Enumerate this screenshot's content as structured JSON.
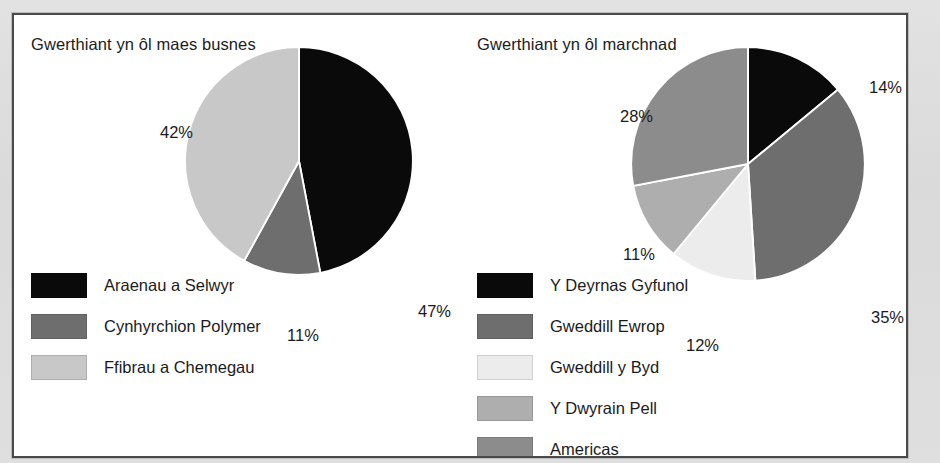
{
  "chart_data": [
    {
      "type": "pie",
      "title": "Gwerthiant yn ôl maes busnes",
      "categories": [
        "Araenau a Selwyr",
        "Cynhyrchion Polymer",
        "Ffibrau a Chemegau"
      ],
      "values": [
        47,
        11,
        42
      ],
      "labels": [
        "47%",
        "11%",
        "42%"
      ],
      "colors": [
        "#0a0a0a",
        "#6e6e6e",
        "#c8c8c8"
      ],
      "legend_position": "bottom-left",
      "start_angle_deg": 0,
      "direction": "clockwise",
      "xlabel": "",
      "ylabel": ""
    },
    {
      "type": "pie",
      "title": "Gwerthiant yn ôl marchnad",
      "categories": [
        "Y Deyrnas Gyfunol",
        "Gweddill Ewrop",
        "Gweddill y Byd",
        "Y Dwyrain Pell",
        "Americas"
      ],
      "values": [
        14,
        35,
        12,
        11,
        28
      ],
      "labels": [
        "14%",
        "35%",
        "12%",
        "11%",
        "28%"
      ],
      "colors": [
        "#0a0a0a",
        "#6e6e6e",
        "#ececec",
        "#aeaeae",
        "#8c8c8c"
      ],
      "legend_position": "bottom-left",
      "start_angle_deg": 0,
      "direction": "clockwise",
      "xlabel": "",
      "ylabel": ""
    }
  ],
  "left_chart": {
    "title": "Gwerthiant yn ôl maes busnes",
    "pct_labels": {
      "fibres": "42%",
      "coatings": "47%",
      "polymer": "11%"
    },
    "legend": [
      {
        "label": "Araenau a Selwyr",
        "color": "#0a0a0a"
      },
      {
        "label": "Cynhyrchion Polymer",
        "color": "#6e6e6e"
      },
      {
        "label": "Ffibrau a Chemegau",
        "color": "#c8c8c8"
      }
    ]
  },
  "right_chart": {
    "title": "Gwerthiant yn ôl marchnad",
    "pct_labels": {
      "americas": "28%",
      "uk": "14%",
      "rest_of_europe": "35%",
      "far_east": "11%",
      "rest_of_world": "12%"
    },
    "legend": [
      {
        "label": "Y Deyrnas Gyfunol",
        "color": "#0a0a0a"
      },
      {
        "label": "Gweddill Ewrop",
        "color": "#6e6e6e"
      },
      {
        "label": "Gweddill y Byd",
        "color": "#ececec"
      },
      {
        "label": "Y Dwyrain Pell",
        "color": "#aeaeae"
      },
      {
        "label": "Americas",
        "color": "#8c8c8c"
      }
    ]
  }
}
